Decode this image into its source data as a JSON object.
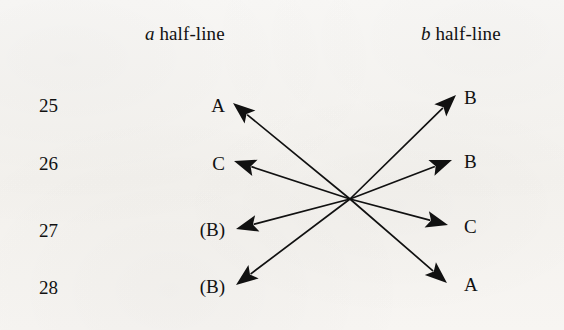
{
  "figure": {
    "type": "diagram",
    "background_color": "#f6f4f1",
    "ink_color": "#111111"
  },
  "headers": {
    "left": {
      "variable": "a",
      "text": "half-line"
    },
    "right": {
      "variable": "b",
      "text": "half-line"
    }
  },
  "rows": [
    {
      "number": "25",
      "left_label": "A",
      "right_label": "B",
      "y": 105,
      "left_tip": {
        "x": 233,
        "y": 103
      },
      "right_tip": {
        "x": 456,
        "y": 95
      }
    },
    {
      "number": "26",
      "left_label": "C",
      "right_label": "B",
      "y": 163,
      "left_tip": {
        "x": 234,
        "y": 161
      },
      "right_tip": {
        "x": 452,
        "y": 160
      }
    },
    {
      "number": "27",
      "left_label": "(B)",
      "right_label": "C",
      "y": 230,
      "left_tip": {
        "x": 236,
        "y": 229
      },
      "right_tip": {
        "x": 448,
        "y": 225
      }
    },
    {
      "number": "28",
      "left_label": "(B)",
      "right_label": "A",
      "y": 287,
      "left_tip": {
        "x": 236,
        "y": 285
      },
      "right_tip": {
        "x": 447,
        "y": 283
      }
    }
  ],
  "crossing_point": {
    "x": 350,
    "y": 199
  },
  "arrows": [
    {
      "name": "arrow-to-left-a-25",
      "from": "crossing",
      "to_row": 0,
      "side": "left"
    },
    {
      "name": "arrow-to-left-c-26",
      "from": "crossing",
      "to_row": 1,
      "side": "left"
    },
    {
      "name": "arrow-to-left-b-27",
      "from": "crossing",
      "to_row": 2,
      "side": "left"
    },
    {
      "name": "arrow-to-left-b-28",
      "from": "crossing",
      "to_row": 3,
      "side": "left"
    },
    {
      "name": "arrow-to-right-b-25",
      "from": "crossing",
      "to_row": 0,
      "side": "right"
    },
    {
      "name": "arrow-to-right-b-26",
      "from": "crossing",
      "to_row": 1,
      "side": "right"
    },
    {
      "name": "arrow-to-right-c-27",
      "from": "crossing",
      "to_row": 2,
      "side": "right"
    },
    {
      "name": "arrow-to-right-a-28",
      "from": "crossing",
      "to_row": 3,
      "side": "right"
    }
  ]
}
